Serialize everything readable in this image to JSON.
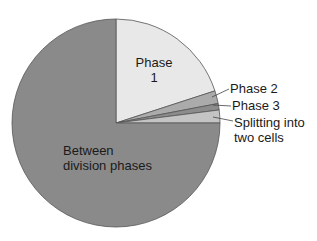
{
  "chart_data": {
    "type": "pie",
    "title": "",
    "start_angle_deg": 90,
    "direction": "clockwise",
    "slices": [
      {
        "label": "Phase 1",
        "value": 20,
        "color": "#e8e8e8"
      },
      {
        "label": "Phase 2",
        "value": 2,
        "color": "#ababab"
      },
      {
        "label": "Phase 3",
        "value": 1,
        "color": "#8c8c8c"
      },
      {
        "label": "Splitting into two cells",
        "value": 2,
        "color": "#c4c4c4"
      },
      {
        "label": "Between division phases",
        "value": 75,
        "color": "#8a8a8a"
      }
    ]
  },
  "labels": {
    "phase1_line1": "Phase",
    "phase1_line2": "1",
    "phase2": "Phase 2",
    "phase3": "Phase 3",
    "splitting_line1": "Splitting into",
    "splitting_line2": "two cells",
    "between_line1": "Between",
    "between_line2": "division phases"
  }
}
